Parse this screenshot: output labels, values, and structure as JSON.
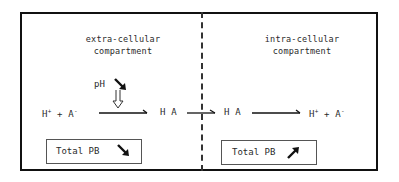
{
  "extracellular": {
    "title_line1": "extra-cellular",
    "title_line2": "compartment",
    "ph_label": "pH",
    "ph_arrow": "down-arrow",
    "reactant_h": "H",
    "reactant_h_charge": "+",
    "plus": "+",
    "reactant_a": "A",
    "reactant_a_charge": "-",
    "product": "H A",
    "total_label": "Total PB",
    "total_trend": "down-arrow"
  },
  "intracellular": {
    "title_line1": "intra-cellular",
    "title_line2": "compartment",
    "reactant": "H A",
    "product_h": "H",
    "product_h_charge": "+",
    "plus": "+",
    "product_a": "A",
    "product_a_charge": "-",
    "total_label": "Total PB",
    "total_trend": "up-arrow"
  },
  "colors": {
    "line": "#111111",
    "text": "#2a2a2a"
  }
}
